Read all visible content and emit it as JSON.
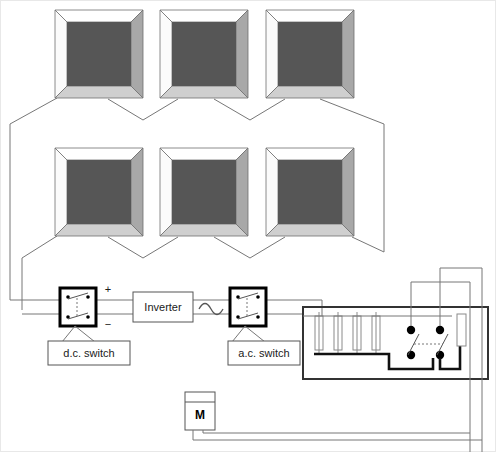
{
  "diagram": {
    "canvas": {
      "width": 496,
      "height": 452,
      "background": "#ffffff"
    }
  },
  "colors": {
    "panel_face": "#565656",
    "panel_bevel_light": "#ffffff",
    "panel_bevel_mid": "#cfcfcf",
    "panel_bevel_dark": "#a8a8a8",
    "thin_wire": "#777777",
    "thick_wire": "#111111",
    "switch_border": "#000000",
    "enclosure_border": "#333333",
    "fuse_outline": "#8a8a8a",
    "text": "#1a1a1a"
  },
  "pv_array": {
    "name": "pv-array",
    "rows": 2,
    "columns": 3,
    "module_count": 6,
    "modules": [
      {
        "id": "module-1",
        "row": 1,
        "col": 1,
        "x": 55,
        "y": 10,
        "w": 88,
        "h": 88
      },
      {
        "id": "module-2",
        "row": 1,
        "col": 2,
        "x": 160,
        "y": 10,
        "w": 88,
        "h": 88
      },
      {
        "id": "module-3",
        "row": 1,
        "col": 3,
        "x": 266,
        "y": 10,
        "w": 88,
        "h": 88
      },
      {
        "id": "module-4",
        "row": 2,
        "col": 1,
        "x": 55,
        "y": 148,
        "w": 88,
        "h": 88
      },
      {
        "id": "module-5",
        "row": 2,
        "col": 2,
        "x": 160,
        "y": 148,
        "w": 88,
        "h": 88
      },
      {
        "id": "module-6",
        "row": 2,
        "col": 3,
        "x": 266,
        "y": 148,
        "w": 88,
        "h": 88
      }
    ]
  },
  "polarity": {
    "positive": "+",
    "negative": "−"
  },
  "components": {
    "dc_switch": {
      "label": "d.c. switch",
      "icon": "double-pole-switch-icon",
      "box": {
        "x": 60,
        "y": 288,
        "w": 36,
        "h": 38
      }
    },
    "inverter": {
      "label": "Inverter",
      "box": {
        "x": 133,
        "y": 292,
        "w": 60,
        "h": 30
      }
    },
    "ac_waveform": {
      "icon": "sine-wave-icon",
      "label": ""
    },
    "ac_switch": {
      "label": "a.c. switch",
      "icon": "double-pole-switch-icon",
      "box": {
        "x": 230,
        "y": 288,
        "w": 36,
        "h": 38
      }
    },
    "meter": {
      "label": "M",
      "name": "electricity-meter",
      "box": {
        "x": 185,
        "y": 392,
        "w": 30,
        "h": 38
      }
    },
    "consumer_unit": {
      "name": "consumer-unit",
      "label": "",
      "box": {
        "x": 303,
        "y": 307,
        "w": 185,
        "h": 72
      },
      "fuse_count": 4,
      "fuses": [
        {
          "id": "fuse-1",
          "x": 319
        },
        {
          "id": "fuse-2",
          "x": 338
        },
        {
          "id": "fuse-3",
          "x": 357
        },
        {
          "id": "fuse-4",
          "x": 376
        }
      ],
      "main_switch": {
        "name": "main-double-pole-switch",
        "poles": 2,
        "linkage": "dashed"
      },
      "busbar": {
        "name": "neutral-busbar"
      }
    }
  },
  "labels": {
    "dc_switch_callout": "d.c. switch",
    "ac_switch_callout": "a.c. switch",
    "inverter_text": "Inverter",
    "meter_text": "M",
    "plus_sign": "+",
    "minus_sign": "−"
  }
}
